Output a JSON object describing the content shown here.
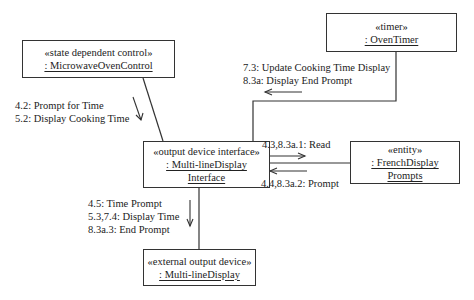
{
  "diagram": {
    "type": "UML communication diagram",
    "objects": [
      {
        "id": "control",
        "stereotype": "«state dependent control»",
        "name": ": MicrowaveOvenControl"
      },
      {
        "id": "timer",
        "stereotype": "«timer»",
        "name": ": OvenTimer"
      },
      {
        "id": "interface",
        "stereotype": "«output device interface»",
        "name_line1": ": Multi-lineDisplay",
        "name_line2": "Interface"
      },
      {
        "id": "prompts",
        "stereotype": "«entity»",
        "name_line1": ": FrenchDisplay",
        "name_line2": "Prompts"
      },
      {
        "id": "device",
        "stereotype": "«external output device»",
        "name": ": Multi-lineDisplay"
      }
    ],
    "messages": {
      "control_to_interface": [
        "4.2: Prompt for Time",
        "5.2: Display Cooking Time"
      ],
      "timer_to_interface": [
        "7.3: Update Cooking Time Display",
        "8.3a: Display End Prompt"
      ],
      "interface_to_prompts": [
        "4.3,8.3a.1: Read"
      ],
      "prompts_to_interface": [
        "4.4,8.3a.2:  Prompt"
      ],
      "interface_to_device": [
        "4.5: Time Prompt",
        "5.3,7.4: Display Time",
        "8.3a.3: End Prompt"
      ]
    },
    "colors": {
      "line": "#333333",
      "text": "#222222",
      "background": "#ffffff"
    }
  }
}
